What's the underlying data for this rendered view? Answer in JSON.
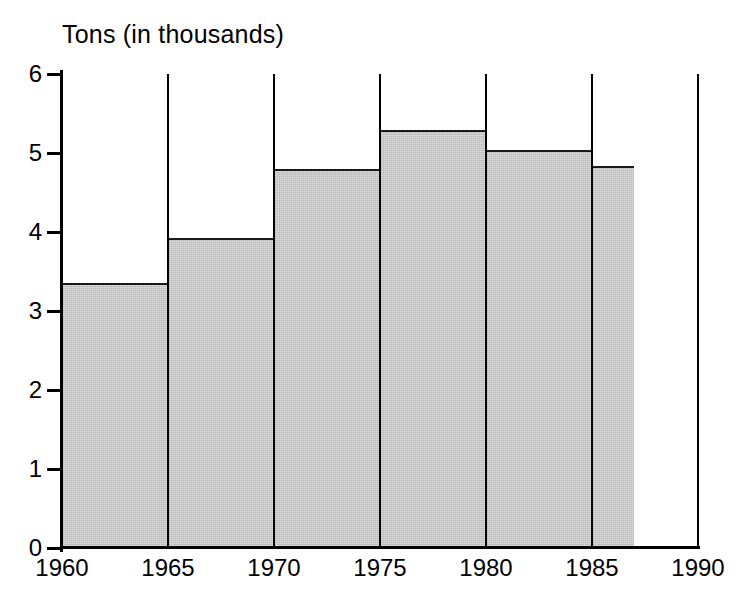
{
  "chart_data": {
    "type": "bar",
    "title": "Tons (in thousands)",
    "xlabel": "",
    "ylabel": "Tons (in thousands)",
    "xlim": [
      1960,
      1990
    ],
    "ylim": [
      0,
      6
    ],
    "grid": true,
    "legend": null,
    "bar_style": "histogram-style contiguous bars spanning year intervals",
    "categories": [
      "1960-1965",
      "1965-1970",
      "1970-1975",
      "1975-1980",
      "1980-1985",
      "1985-1987"
    ],
    "values": [
      3.35,
      3.93,
      4.8,
      5.29,
      5.04,
      4.83
    ],
    "bars": [
      {
        "label": "1960-1965",
        "x_start": 1960,
        "x_end": 1965,
        "value": 3.35
      },
      {
        "label": "1965-1970",
        "x_start": 1965,
        "x_end": 1970,
        "value": 3.93
      },
      {
        "label": "1970-1975",
        "x_start": 1970,
        "x_end": 1975,
        "value": 4.8
      },
      {
        "label": "1975-1980",
        "x_start": 1975,
        "x_end": 1980,
        "value": 5.29
      },
      {
        "label": "1980-1985",
        "x_start": 1980,
        "x_end": 1985,
        "value": 5.04
      },
      {
        "label": "1985-1987",
        "x_start": 1985,
        "x_end": 1987,
        "value": 4.83
      }
    ],
    "y_ticks": [
      0,
      1,
      2,
      3,
      4,
      5,
      6
    ],
    "y_tick_labels": [
      "0",
      "1",
      "2",
      "3",
      "4",
      "5",
      "6"
    ],
    "x_ticks": [
      1960,
      1965,
      1970,
      1975,
      1980,
      1985,
      1990
    ],
    "x_tick_labels": [
      "1960",
      "1965",
      "1970",
      "1975",
      "1980",
      "1985",
      "1990"
    ],
    "colors": {
      "bar_fill": "#b9b9b9",
      "bar_outline": "#1a1a1a",
      "axis": "#000000",
      "gridline": "#000000",
      "background": "#ffffff",
      "text": "#000000"
    }
  }
}
